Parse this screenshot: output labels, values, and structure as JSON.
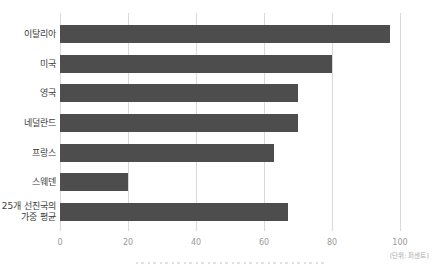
{
  "chart_data": {
    "type": "bar",
    "orientation": "horizontal",
    "title": "",
    "xlabel": "",
    "ylabel": "",
    "unit_label": "(단위: 퍼센트)",
    "categories": [
      "이탈리아",
      "미국",
      "영국",
      "네덜란드",
      "프랑스",
      "스웨덴",
      "25개 선진국의\n가중 평균"
    ],
    "values": [
      97,
      80,
      70,
      70,
      63,
      20,
      67
    ],
    "xlim": [
      0,
      100
    ],
    "xticks": [
      0,
      20,
      40,
      60,
      80,
      100
    ],
    "grid": true,
    "legend": false,
    "bar_color": "#4d4d4d",
    "gridline_color": "#d9d9d9",
    "tick_label_color": "#9a9a9a",
    "category_label_color": "#3d3d3d"
  }
}
